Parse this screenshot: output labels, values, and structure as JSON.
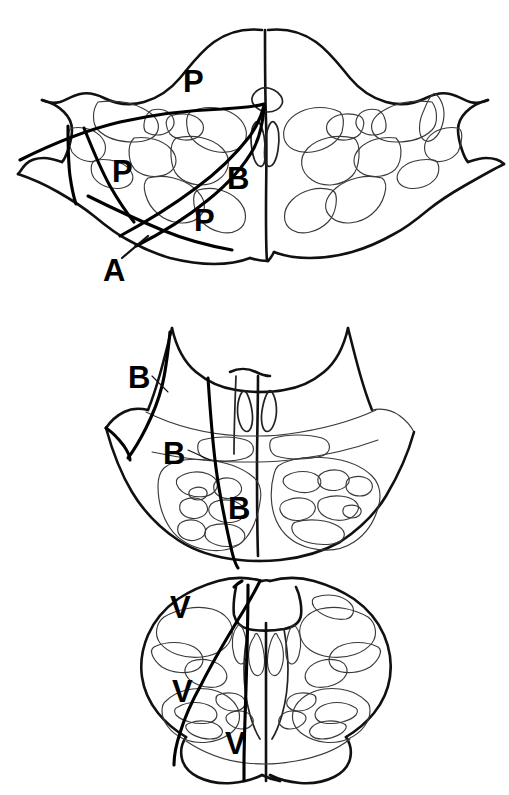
{
  "figure": {
    "background_color": "#ffffff",
    "ink_color": "#111111",
    "light_ink_color": "#3a3a3a",
    "label_color": "#000000",
    "width": 509,
    "height": 795,
    "panel_count": 3
  },
  "panels": [
    {
      "id": "panel-upper",
      "name": "upper-section",
      "description": "Rostral pons / midbrain level transverse section",
      "labels": [
        {
          "text": "P",
          "x": 183,
          "y": 66,
          "has_leader": false
        },
        {
          "text": "P",
          "x": 112,
          "y": 156,
          "has_leader": false
        },
        {
          "text": "B",
          "x": 227,
          "y": 163,
          "has_leader": false
        },
        {
          "text": "P",
          "x": 194,
          "y": 205,
          "has_leader": false
        },
        {
          "text": "A",
          "x": 103,
          "y": 255,
          "has_leader": true
        }
      ]
    },
    {
      "id": "panel-middle",
      "name": "middle-section",
      "description": "Ponto-medullary junction transverse section",
      "labels": [
        {
          "text": "B",
          "x": 128,
          "y": 362,
          "has_leader": true
        },
        {
          "text": "B",
          "x": 163,
          "y": 438,
          "has_leader": true
        },
        {
          "text": "B",
          "x": 228,
          "y": 493,
          "has_leader": false
        }
      ]
    },
    {
      "id": "panel-lower",
      "name": "lower-section",
      "description": "Medulla transverse section",
      "labels": [
        {
          "text": "V",
          "x": 170,
          "y": 592,
          "has_leader": false
        },
        {
          "text": "V",
          "x": 172,
          "y": 676,
          "has_leader": false
        },
        {
          "text": "V",
          "x": 225,
          "y": 728,
          "has_leader": false
        }
      ]
    }
  ],
  "caption": {
    "text": "",
    "visible": false,
    "note": "bottom edge shows a cropped, illegible caption strip"
  },
  "legend_keys": [
    {
      "symbol": "P",
      "meaning_shown": ""
    },
    {
      "symbol": "B",
      "meaning_shown": ""
    },
    {
      "symbol": "A",
      "meaning_shown": ""
    },
    {
      "symbol": "V",
      "meaning_shown": ""
    }
  ]
}
